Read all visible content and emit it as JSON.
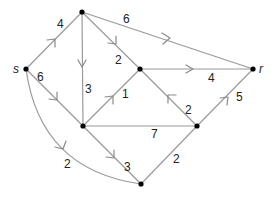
{
  "diagram": {
    "type": "directed weighted network (flow graph)",
    "nodes": [
      {
        "id": "s",
        "label": "s",
        "x": 26,
        "y": 69
      },
      {
        "id": "A",
        "label": "",
        "x": 82,
        "y": 12
      },
      {
        "id": "B",
        "label": "",
        "x": 140,
        "y": 69
      },
      {
        "id": "r",
        "label": "r",
        "x": 253,
        "y": 69
      },
      {
        "id": "C",
        "label": "",
        "x": 83,
        "y": 126
      },
      {
        "id": "D",
        "label": "",
        "x": 197,
        "y": 126
      },
      {
        "id": "E",
        "label": "",
        "x": 141,
        "y": 184
      }
    ],
    "edges": [
      {
        "from": "s",
        "to": "A",
        "weight": "4",
        "directed": true
      },
      {
        "from": "A",
        "to": "r",
        "weight": "6",
        "directed": true
      },
      {
        "from": "A",
        "to": "C",
        "weight": "3",
        "directed": true
      },
      {
        "from": "A",
        "to": "B",
        "weight": "2",
        "directed": true
      },
      {
        "from": "s",
        "to": "C",
        "weight": "6",
        "directed": true
      },
      {
        "from": "C",
        "to": "B",
        "weight": "1",
        "directed": true
      },
      {
        "from": "B",
        "to": "r",
        "weight": "4",
        "directed": true
      },
      {
        "from": "D",
        "to": "B",
        "weight": "2",
        "directed": true
      },
      {
        "from": "C",
        "to": "D",
        "weight": "7",
        "directed": false
      },
      {
        "from": "D",
        "to": "r",
        "weight": "5",
        "directed": true
      },
      {
        "from": "C",
        "to": "E",
        "weight": "3",
        "directed": true
      },
      {
        "from": "s",
        "to": "E",
        "weight": "2",
        "directed": true,
        "curved": true
      },
      {
        "from": "E",
        "to": "D",
        "weight": "2",
        "directed": false
      }
    ],
    "labels": {
      "s": "s",
      "r": "r",
      "w_sA": "4",
      "w_Ar": "6",
      "w_AC": "3",
      "w_AB": "2",
      "w_sC": "6",
      "w_CB": "1",
      "w_Br": "4",
      "w_DB": "2",
      "w_CD": "7",
      "w_Dr": "5",
      "w_CE": "3",
      "w_sE": "2",
      "w_ED": "2"
    },
    "colors": {
      "edge": "#9a9a9a",
      "node": "#000000",
      "text": "#222222"
    }
  }
}
